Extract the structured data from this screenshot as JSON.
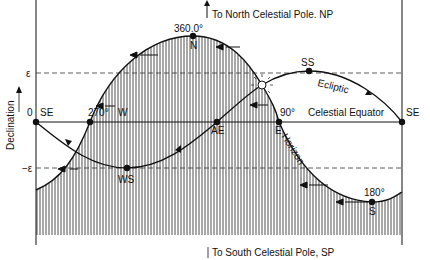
{
  "diagram": {
    "y_axis_label": "Declination",
    "pole_labels": {
      "north": "To North Celestial Pole. NP",
      "south": "To South Celestial Pole, SP"
    },
    "declination_ticks": {
      "plus_epsilon": "ε",
      "zero": "0",
      "minus_epsilon": "−ε"
    },
    "curves": {
      "ecliptic": "Ecliptic",
      "celestial_equator": "Celestial Equator",
      "horizon": "Horizon"
    },
    "points": {
      "se_left": "SE",
      "se_right": "SE",
      "north": "N",
      "north_angle": "360.0°",
      "west": "W",
      "west_angle": "270°",
      "east": "E",
      "east_angle": "90°",
      "south": "S",
      "south_angle": "180°",
      "autumn_equinox": "AE",
      "summer_solstice": "SS",
      "winter_solstice": "WS"
    },
    "colors": {
      "line": "#111111",
      "background": "#ffffff"
    }
  }
}
